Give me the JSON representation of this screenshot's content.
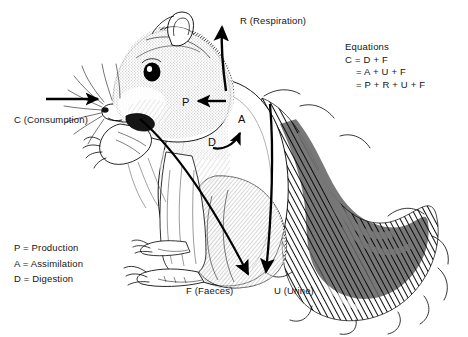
{
  "figure": {
    "background_color": "#ffffff",
    "ink_color": "#111111"
  },
  "labels": {
    "consumption": "C (Consumption)",
    "respiration": "R (Respiration)",
    "production": "P",
    "assimilation": "A",
    "digestion": "D",
    "faeces": "F (Faeces)",
    "urine": "U (Urine)"
  },
  "equations": {
    "title": "Equations",
    "lines": [
      "C = D + F",
      "= A + U + F",
      "= P + R + U + F"
    ]
  },
  "legend": {
    "items": [
      "P = Production",
      "A = Assimilation",
      "D = Digestion"
    ]
  },
  "arrows": [
    {
      "name": "consumption-arrow",
      "label": "C (Consumption)",
      "direction": "right"
    },
    {
      "name": "respiration-arrow",
      "label": "R (Respiration)",
      "direction": "up"
    },
    {
      "name": "production-arrow",
      "label": "P",
      "direction": "left"
    },
    {
      "name": "assimilation-arrow",
      "label": "A",
      "direction": "up-right"
    },
    {
      "name": "faeces-arrow",
      "label": "F (Faeces)",
      "direction": "down"
    },
    {
      "name": "urine-arrow",
      "label": "U (Urine)",
      "direction": "down"
    }
  ]
}
